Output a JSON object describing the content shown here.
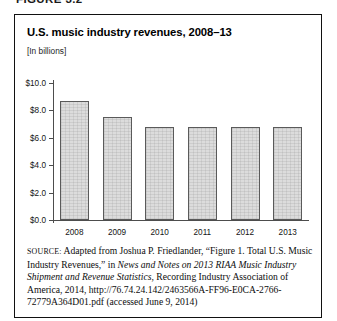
{
  "figure_header": "FIGURE 3.2",
  "chart": {
    "title": "U.S. music industry revenues, 2008–13",
    "subtitle": "[In billions]"
  },
  "source": {
    "label": "SOURCE:",
    "part1": " Adapted from Joshua P. Friedlander, “Figure 1. Total U.S. Music Industry Revenues,” in ",
    "italic1": "News and Notes on 2013 RIAA Music Industry Shipment and Revenue Statistics",
    "part2": ", Recording Industry Association of America, 2014, http://76.74.24.142/2463566A-FF96-E0CA-2766-72779A364D01.pdf (accessed June 9, 2014)"
  },
  "chart_data": {
    "type": "bar",
    "title": "U.S. music industry revenues, 2008–13",
    "subtitle": "[In billions]",
    "xlabel": "",
    "ylabel": "[In billions]",
    "categories": [
      "2008",
      "2009",
      "2010",
      "2011",
      "2012",
      "2013"
    ],
    "values": [
      8.7,
      7.5,
      6.8,
      6.8,
      6.8,
      6.8
    ],
    "ylim": [
      0.0,
      10.0
    ],
    "ytick_step": 2.0,
    "ytick_values": [
      0.0,
      2.0,
      4.0,
      6.0,
      8.0,
      10.0
    ],
    "ytick_labels": [
      "$0.0",
      "$2.0",
      "$4.0",
      "$6.0",
      "$8.0",
      "$10.0"
    ],
    "grid": false,
    "legend": false,
    "bar_fill_color": "#dcdcdc",
    "bar_border_color": "#5a5a5a",
    "axis_color": "#4d4d4d"
  }
}
